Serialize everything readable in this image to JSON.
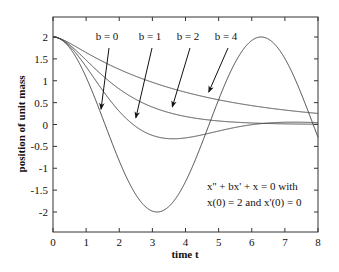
{
  "chart_data": {
    "type": "line",
    "title": "",
    "xlabel": "time t",
    "ylabel": "position of unit mass",
    "xlim": [
      0,
      8
    ],
    "ylim": [
      -2.45,
      2.45
    ],
    "xticks": [
      "0",
      "1",
      "2",
      "3",
      "4",
      "5",
      "6",
      "7",
      "8"
    ],
    "xtick_values": [
      0,
      1,
      2,
      3,
      4,
      5,
      6,
      7,
      8
    ],
    "yticks": [
      "2",
      "1.5",
      "1",
      "0.5",
      "0",
      "-0.5",
      "-1",
      "-1.5",
      "-2"
    ],
    "ytick_values": [
      2,
      1.5,
      1,
      0.5,
      0,
      -0.5,
      -1,
      -1.5,
      -2
    ],
    "grid": false,
    "equation": "x'' + bx' + x = 0",
    "initial_conditions": {
      "x0": 2,
      "v0": 0
    },
    "series": [
      {
        "name": "b = 0",
        "b": 0,
        "label": "b = 0"
      },
      {
        "name": "b = 1",
        "b": 1,
        "label": "b = 1"
      },
      {
        "name": "b = 2",
        "b": 2,
        "label": "b = 2"
      },
      {
        "name": "b = 4",
        "b": 4,
        "label": "b = 4"
      }
    ],
    "annotations": [
      "x'' + bx' + x = 0 with",
      "x(0) = 2 and x'(0) = 0"
    ],
    "arrow_targets": [
      {
        "label": "b = 0",
        "x": 1.45,
        "y": 0.35
      },
      {
        "label": "b = 1",
        "x": 2.5,
        "y": 0.15
      },
      {
        "label": "b = 2",
        "x": 3.6,
        "y": 0.4
      },
      {
        "label": "b = 4",
        "x": 4.7,
        "y": 0.74
      }
    ]
  }
}
